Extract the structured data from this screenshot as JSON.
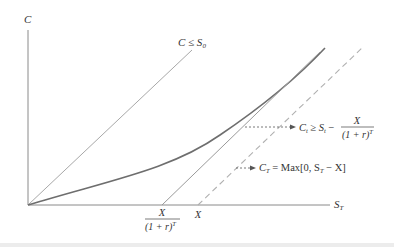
{
  "axes": {
    "y_label": "C",
    "x_label_main": "S",
    "x_label_sub": "T"
  },
  "lines": {
    "upper_bound_label": {
      "main": "C ≤ S",
      "sub": "0"
    },
    "lower_bound_annotation": {
      "lhs_main": "C",
      "lhs_sub": "t",
      "relation": " ≥ S",
      "rhs_sub": "t",
      "minus": " − ",
      "numerator": "X",
      "denominator": "(1 + r)",
      "denominator_sup": "T"
    },
    "payoff_annotation": {
      "lhs_main": "C",
      "lhs_sub": "T",
      "rest_a": " = Max[0,  S",
      "rest_sub": "T",
      "rest_b": " − X]"
    }
  },
  "x_ticks": {
    "pv_strike_numerator": "X",
    "pv_strike_denominator": "(1 + r)",
    "pv_strike_denominator_sup": "T",
    "strike": "X"
  },
  "colors": {
    "axis": "#8a8a8a",
    "upper_line": "#a8a8a8",
    "curve": "#6e6e6e",
    "lower_line": "#9a9a9a",
    "dashed": "#b0b0b0",
    "arrow": "#555555"
  }
}
